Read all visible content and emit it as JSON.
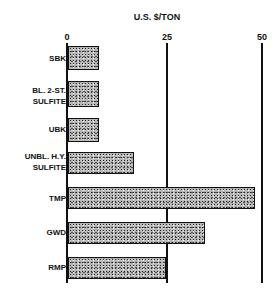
{
  "chart_data": {
    "type": "bar",
    "orientation": "horizontal",
    "title": "U.S. $/TON",
    "xlabel": "U.S. $/TON",
    "ylabel": "",
    "xlim": [
      0,
      50
    ],
    "xticks": [
      "0",
      "25",
      "50"
    ],
    "grid": "vertical lines at 25 and 50",
    "categories": [
      "SBK",
      "BL. 2-ST. SULFITE",
      "UBK",
      "UNBL. H.Y. SULFITE",
      "TMP",
      "GWD",
      "RMP"
    ],
    "values": [
      8,
      8,
      8,
      17,
      48,
      35,
      25
    ]
  },
  "labels": {
    "title": "U.S. $/TON",
    "tick0": "0",
    "tick25": "25",
    "tick50": "50",
    "c0": "SBK",
    "c1a": "BL. 2-ST.",
    "c1b": "SULFITE",
    "c2": "UBK",
    "c3a": "UNBL. H.Y.",
    "c3b": "SULFITE",
    "c4": "TMP",
    "c5": "GWD",
    "c6": "RMP"
  }
}
